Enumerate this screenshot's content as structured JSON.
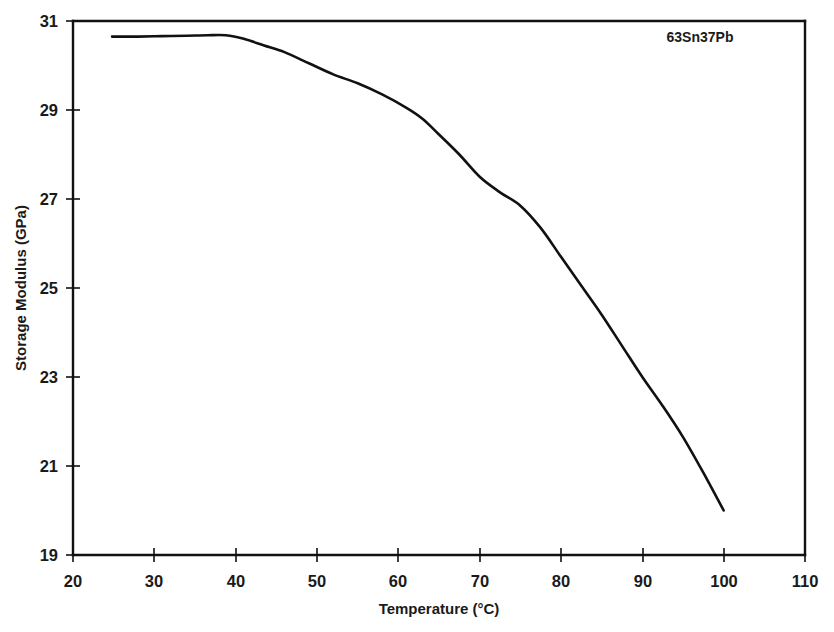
{
  "chart_data": {
    "type": "line",
    "title": "",
    "xlabel": "Temperature (°C)",
    "ylabel": "Storage Modulus (GPa)",
    "xlim": [
      20,
      110
    ],
    "ylim": [
      19,
      31
    ],
    "xticks": [
      20,
      30,
      40,
      50,
      60,
      70,
      80,
      90,
      100,
      110
    ],
    "yticks": [
      19,
      21,
      23,
      25,
      27,
      29,
      31
    ],
    "grid": false,
    "legend": false,
    "annotations": [
      {
        "text": "63Sn37Pb",
        "x": 95,
        "y": 30.6
      }
    ],
    "series": [
      {
        "name": "63Sn37Pb",
        "color": "#111111",
        "x": [
          24.8,
          28.0,
          31.0,
          34.0,
          36.5,
          38.8,
          41.0,
          43.5,
          46.0,
          49.0,
          52.0,
          55.0,
          58.0,
          61.0,
          63.0,
          65.0,
          67.5,
          70.0,
          72.5,
          75.0,
          77.5,
          80.0,
          82.5,
          85.0,
          87.5,
          90.0,
          92.5,
          95.0,
          97.5,
          100.0
        ],
        "y": [
          30.65,
          30.65,
          30.66,
          30.67,
          30.68,
          30.68,
          30.6,
          30.45,
          30.3,
          30.05,
          29.8,
          29.6,
          29.35,
          29.05,
          28.8,
          28.45,
          28.0,
          27.5,
          27.15,
          26.85,
          26.35,
          25.7,
          25.05,
          24.4,
          23.7,
          23.0,
          22.35,
          21.65,
          20.85,
          20.0
        ]
      }
    ]
  },
  "axes": {
    "x_tick_labels": [
      "20",
      "30",
      "40",
      "50",
      "60",
      "70",
      "80",
      "90",
      "100",
      "110"
    ],
    "y_tick_labels": [
      "19",
      "21",
      "23",
      "25",
      "27",
      "29",
      "31"
    ],
    "x_title": "Temperature (°C)",
    "y_title": "Storage Modulus (GPa)"
  },
  "annotation": {
    "material_label": "63Sn37Pb"
  }
}
